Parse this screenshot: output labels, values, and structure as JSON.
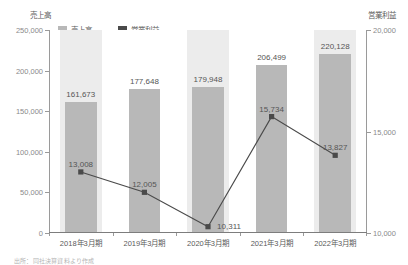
{
  "chart_data": {
    "type": "bar",
    "title": "",
    "categories": [
      "2018年3月期",
      "2019年3月期",
      "2020年3月期",
      "2021年3月期",
      "2022年3月期"
    ],
    "series": [
      {
        "name": "売上高",
        "type": "bar",
        "axis": "left",
        "color": "#b8b8b8",
        "values": [
          161673,
          177648,
          179948,
          206499,
          220128
        ],
        "labels": [
          "161,673",
          "177,648",
          "179,948",
          "206,499",
          "220,128"
        ]
      },
      {
        "name": "営業利益",
        "type": "line",
        "axis": "right",
        "color": "#4a4a4a",
        "values": [
          13008,
          12005,
          10311,
          15734,
          13827
        ],
        "labels": [
          "13,008",
          "12,005",
          "10,311",
          "15,734",
          "13,827"
        ]
      }
    ],
    "xlabel": "",
    "ylabel": "売上高",
    "y2label": "営業利益",
    "ylim": [
      0,
      250000
    ],
    "y2lim": [
      10000,
      20000
    ],
    "yticks": [
      0,
      50000,
      100000,
      150000,
      200000,
      250000
    ],
    "ytick_labels": [
      "0",
      "50,000",
      "100,000",
      "150,000",
      "200,000",
      "250,000"
    ],
    "y2ticks": [
      10000,
      15000,
      20000
    ],
    "y2tick_labels": [
      "10,000",
      "15,000",
      "20,000"
    ],
    "grid": false,
    "legend_position": "top-left",
    "alternating_bands": true
  },
  "axes": {
    "left_title": "売上高",
    "right_title": "営業利益"
  },
  "legend": {
    "items": [
      {
        "label": "売上高",
        "color": "#b8b8b8"
      },
      {
        "label": "営業利益",
        "color": "#4a4a4a"
      }
    ]
  },
  "footer": {
    "source_note": "出所：同社決算資料より作成"
  }
}
